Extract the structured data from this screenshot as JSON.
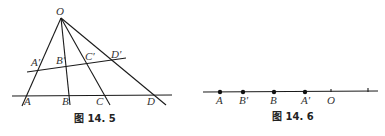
{
  "figures": [
    {
      "caption": "图 14. 5",
      "labels": {
        "O": "O",
        "A_prime": "A′",
        "B_prime": "B′",
        "C_prime": "C′",
        "D_prime": "D′",
        "A": "A",
        "B": "B",
        "C": "C",
        "D": "D"
      }
    },
    {
      "caption": "图 14. 6",
      "labels": {
        "A": "A",
        "B_prime": "B′",
        "B": "B",
        "A_prime": "A′",
        "O": "O"
      }
    }
  ],
  "colors": {
    "stroke": "#1a1a1a",
    "text": "#333333",
    "background": "#ffffff"
  }
}
